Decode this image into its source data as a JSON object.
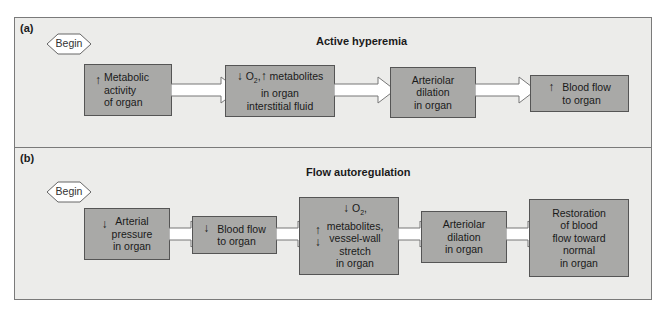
{
  "panel_a": {
    "label": "(a)",
    "title": "Active hyperemia",
    "begin": "Begin",
    "boxes": [
      {
        "text": "Metabolic\nactivity\nof organ",
        "arrow": "up"
      },
      {
        "text_part1": "O",
        "text_sub": "2",
        "text_part2": ",",
        "text_part3": " metabolites\nin organ\ninterstitial fluid"
      },
      {
        "text": "Arteriolar\ndilation\nin organ"
      },
      {
        "text": "Blood flow\nto organ",
        "arrow": "up"
      }
    ]
  },
  "panel_b": {
    "label": "(b)",
    "title": "Flow autoregulation",
    "begin": "Begin",
    "boxes": [
      {
        "text": "Arterial\npressure\nin organ",
        "arrow": "down"
      },
      {
        "text": "Blood flow\nto organ",
        "arrow": "down"
      },
      {
        "o2": "O",
        "o2_sub": "2",
        "o2_suffix": ",",
        "text": "metabolites,\nvessel-wall\nstretch\nin organ"
      },
      {
        "text": "Arteriolar\ndilation\nin organ"
      },
      {
        "text": "Restoration\nof blood\nflow toward\nnormal\nin organ"
      }
    ]
  },
  "colors": {
    "panel_bg": "#ececea",
    "box_fill": "#a9a9a7",
    "border": "#555555"
  }
}
